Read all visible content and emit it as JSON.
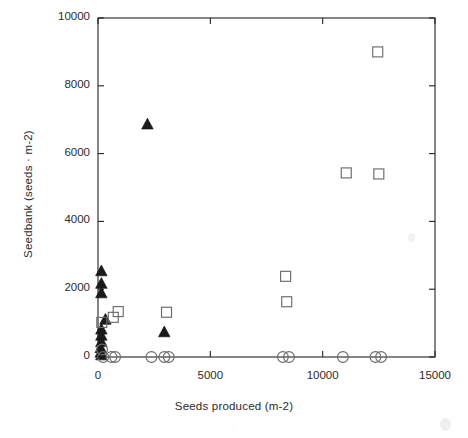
{
  "figure": {
    "background": "#ffffff",
    "ink_color": "#222222"
  },
  "chart_data": {
    "type": "scatter",
    "title": "",
    "xlabel": "Seeds produced (m-2)",
    "ylabel": "Seedbank (seeds · m-2)",
    "xlim": [
      0,
      15000
    ],
    "ylim": [
      0,
      10000
    ],
    "xticks": [
      0,
      5000,
      10000,
      15000
    ],
    "xtick_labels": [
      "0",
      "5000",
      "10000",
      "15000"
    ],
    "yticks": [
      0,
      2000,
      4000,
      6000,
      8000,
      10000
    ],
    "ytick_labels": [
      "0",
      "2000",
      "4000",
      "6000",
      "8000",
      "10000"
    ],
    "grid": false,
    "legend": null,
    "legend_position": "none",
    "series": [
      {
        "name": "filled-triangle",
        "marker": "triangle",
        "fill": "#1a1a1a",
        "stroke": "#1a1a1a",
        "points": [
          {
            "x": 2200,
            "y": 6850
          },
          {
            "x": 150,
            "y": 2520
          },
          {
            "x": 150,
            "y": 2150
          },
          {
            "x": 150,
            "y": 1870
          },
          {
            "x": 330,
            "y": 1090
          },
          {
            "x": 150,
            "y": 800
          },
          {
            "x": 150,
            "y": 620
          },
          {
            "x": 150,
            "y": 430
          },
          {
            "x": 120,
            "y": 250
          },
          {
            "x": 120,
            "y": 120
          },
          {
            "x": 150,
            "y": 40
          },
          {
            "x": 2950,
            "y": 720
          }
        ]
      },
      {
        "name": "open-square",
        "marker": "square",
        "fill": "none",
        "stroke": "#6b6b6b",
        "points": [
          {
            "x": 12450,
            "y": 9000
          },
          {
            "x": 11050,
            "y": 5430
          },
          {
            "x": 12500,
            "y": 5400
          },
          {
            "x": 8350,
            "y": 2380
          },
          {
            "x": 8400,
            "y": 1630
          },
          {
            "x": 3050,
            "y": 1320
          },
          {
            "x": 900,
            "y": 1340
          },
          {
            "x": 680,
            "y": 1170
          },
          {
            "x": 170,
            "y": 1020
          }
        ]
      },
      {
        "name": "open-circle",
        "marker": "circle",
        "fill": "none",
        "stroke": "#6b6b6b",
        "points": [
          {
            "x": 230,
            "y": 0
          },
          {
            "x": 600,
            "y": 0
          },
          {
            "x": 760,
            "y": 0
          },
          {
            "x": 2380,
            "y": 0
          },
          {
            "x": 2950,
            "y": 0
          },
          {
            "x": 3150,
            "y": 0
          },
          {
            "x": 8230,
            "y": 0
          },
          {
            "x": 8500,
            "y": 0
          },
          {
            "x": 10900,
            "y": 0
          },
          {
            "x": 12350,
            "y": 0
          },
          {
            "x": 12600,
            "y": 0
          },
          {
            "x": 180,
            "y": 220
          }
        ]
      }
    ]
  },
  "artifacts": {
    "ghost_caption": "·",
    "has_scan_smudge": true
  }
}
